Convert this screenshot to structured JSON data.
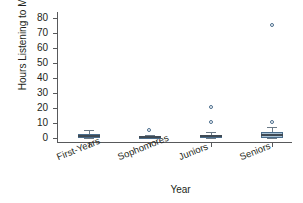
{
  "chart_data": {
    "type": "box",
    "title": "",
    "xlabel": "Year",
    "ylabel": "Hours Listening to Music",
    "categories": [
      "First-Years",
      "Sophomores",
      "Juniors",
      "Seniors"
    ],
    "ylim": [
      -3,
      84
    ],
    "yticks": [
      0,
      10,
      20,
      30,
      40,
      50,
      60,
      70,
      80
    ],
    "ytick_labels": [
      "0",
      "10",
      "20",
      "30",
      "40",
      "50",
      "60",
      "70",
      "80"
    ],
    "grid": false,
    "legend": null,
    "colors": {
      "box_fill": "#a9c3d6",
      "box_edge": "#4a6d8c",
      "median": "#3f4a54",
      "whisker": "#6b7a87",
      "flier_edge": "#4a6d8c",
      "axis": "#58595b",
      "text": "#231f20",
      "background": "#ffffff"
    },
    "boxes": [
      {
        "category": "First-Years",
        "whisker_low": 0,
        "q1": 0,
        "median": 1,
        "q3": 2.5,
        "whisker_high": 5,
        "fliers": []
      },
      {
        "category": "Sophomores",
        "whisker_low": 0,
        "q1": 0,
        "median": 0.3,
        "q3": 0.8,
        "whisker_high": 2,
        "fliers": [
          5
        ]
      },
      {
        "category": "Juniors",
        "whisker_low": 0,
        "q1": 0,
        "median": 1,
        "q3": 2,
        "whisker_high": 4,
        "fliers": [
          10,
          20
        ]
      },
      {
        "category": "Seniors",
        "whisker_low": 0,
        "q1": 0,
        "median": 2,
        "q3": 4,
        "whisker_high": 7,
        "fliers": [
          10,
          75
        ]
      }
    ]
  }
}
